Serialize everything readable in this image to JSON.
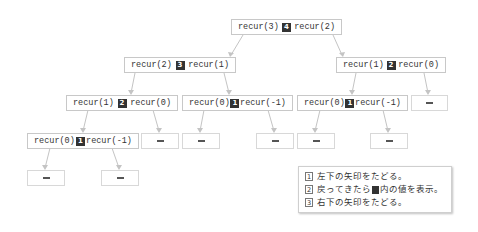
{
  "tree": {
    "nodes": [
      {
        "id": "n-root",
        "left": "recur(3)",
        "badge": "4",
        "right": "recur(2)"
      },
      {
        "id": "n-l2a",
        "left": "recur(2)",
        "badge": "3",
        "right": "recur(1)"
      },
      {
        "id": "n-l2b",
        "left": "recur(1)",
        "badge": "2",
        "right": "recur(0)"
      },
      {
        "id": "n-l3a",
        "left": "recur(1)",
        "badge": "2",
        "right": "recur(0)"
      },
      {
        "id": "n-l3b",
        "left": "recur(0)",
        "badge": "1",
        "right": "recur(-1)"
      },
      {
        "id": "n-l3c",
        "left": "recur(0)",
        "badge": "1",
        "right": "recur(-1)"
      },
      {
        "id": "n-l4a",
        "left": "recur(0)",
        "badge": "1",
        "right": "recur(-1)"
      }
    ],
    "leaf_label": "–"
  },
  "legend": {
    "items": [
      {
        "num": "1",
        "text_before": "左下の矢印をたどる。",
        "text_after": ""
      },
      {
        "num": "2",
        "text_before": "戻ってきたら",
        "text_after": "内の値を表示。"
      },
      {
        "num": "3",
        "text_before": "右下の矢印をたどる。",
        "text_after": ""
      }
    ]
  },
  "colors": {
    "badge": "#333333",
    "border": "#c8c8c8",
    "arrow": "#bdbdbd"
  }
}
